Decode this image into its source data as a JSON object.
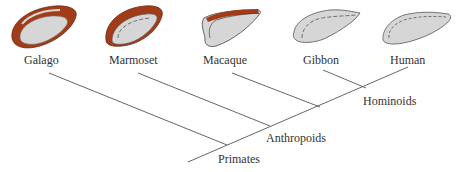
{
  "diagram": {
    "type": "phylogenetic-tree",
    "colors": {
      "cortex_fill": "#d6d6d6",
      "outline": "#555555",
      "highlight": "#a23c18",
      "line": "#555555",
      "text": "#333333"
    },
    "taxa": [
      {
        "name": "Galago",
        "brain_highlight": "extensive"
      },
      {
        "name": "Marmoset",
        "brain_highlight": "dorsal-rim"
      },
      {
        "name": "Macaque",
        "brain_highlight": "dorsal-edge"
      },
      {
        "name": "Gibbon",
        "brain_highlight": "none"
      },
      {
        "name": "Human",
        "brain_highlight": "none"
      }
    ],
    "clades": [
      {
        "name": "Hominoids"
      },
      {
        "name": "Anthropoids"
      },
      {
        "name": "Primates"
      }
    ]
  }
}
